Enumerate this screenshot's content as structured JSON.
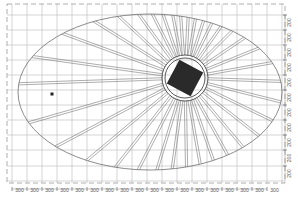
{
  "drawing": {
    "type": "elliptical radial beam plan",
    "colors": {
      "background": "#ffffff",
      "grid": "#b8b8b8",
      "outline": "#6f6f6f",
      "column_fill": "#2a2a2a"
    },
    "grid": {
      "x_lines": [
        12,
        27,
        42,
        57,
        72,
        87,
        102,
        117,
        132,
        147,
        162,
        177,
        192,
        207,
        222,
        237,
        252,
        267,
        282
      ],
      "y_lines": [
        15,
        30,
        45,
        60,
        75,
        90,
        105,
        120,
        135,
        150,
        166,
        181
      ]
    },
    "border": {
      "x": 7,
      "y": 4,
      "width": 278,
      "height": 179
    },
    "ellipse": {
      "cx": 150,
      "cy": 92,
      "rx": 132,
      "ry": 78
    },
    "core": {
      "cx": 185,
      "cy": 78,
      "outer_radius": 23,
      "inner_radius": 20,
      "square_size": 27,
      "square_rotation_deg": 28
    },
    "beam_angles_deg": [
      -172,
      -160,
      -148,
      -137,
      -126,
      -117,
      -109,
      -101,
      -94,
      -87,
      -80,
      -72,
      -64,
      -55,
      -45,
      -34,
      -22,
      -10,
      2,
      14,
      26,
      38,
      50,
      61,
      71,
      80,
      89,
      98,
      107,
      117,
      128,
      140,
      152,
      164,
      178
    ],
    "marker": {
      "x": 52,
      "y": 94,
      "size": 3
    },
    "bottom_dimensions": {
      "y": 191,
      "labels": [
        "300",
        "300",
        "300",
        "300",
        "300",
        "300",
        "300",
        "300",
        "300",
        "300",
        "300",
        "300",
        "300",
        "300",
        "300",
        "300",
        "300",
        "300"
      ]
    },
    "right_dimensions": {
      "x": 291,
      "labels": [
        "200",
        "200",
        "200",
        "200",
        "200",
        "200",
        "200",
        "200",
        "200",
        "200",
        "200"
      ]
    }
  }
}
